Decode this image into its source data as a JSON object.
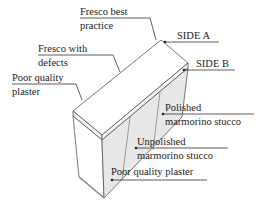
{
  "diagram": {
    "type": "wall-section-illustration",
    "labels": {
      "fresco_best_l1": "Fresco best",
      "fresco_best_l2": "practice",
      "fresco_defects_l1": "Fresco with",
      "fresco_defects_l2": "defects",
      "poor_plaster_l1": "Poor quality",
      "poor_plaster_l2": "plaster",
      "side_a": "SIDE A",
      "side_b": "SIDE B",
      "polished_l1": "Polished",
      "polished_l2": "marmorino stucco",
      "unpolished_l1": "Unpolished",
      "unpolished_l2": "marmorino stucco",
      "poor_plaster_b": "Poor quality plaster"
    },
    "colors": {
      "line": "#333333",
      "face_fill": "#e6e6e6",
      "top_fill": "#ffffff"
    }
  }
}
